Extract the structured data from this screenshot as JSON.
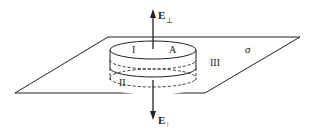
{
  "diagram": {
    "labels": {
      "plane": "σ",
      "top_face": "I",
      "area": "A",
      "bottom_face": "II",
      "side": "III",
      "field_up": "E",
      "field_up_sub": "⊥",
      "field_down": "E",
      "field_down_sub": "|"
    },
    "colors": {
      "stroke": "#222222",
      "background": "#ffffff"
    }
  }
}
